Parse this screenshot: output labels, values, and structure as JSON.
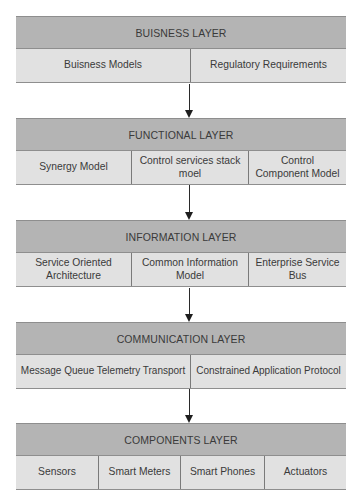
{
  "diagram": {
    "layers": [
      {
        "title": "BUISNESS LAYER",
        "items": [
          "Buisness Models",
          "Regulatory Requirements"
        ]
      },
      {
        "title": "FUNCTIONAL LAYER",
        "items": [
          "Synergy Model",
          "Control services stack moel",
          "Control Component Model"
        ]
      },
      {
        "title": "INFORMATION LAYER",
        "items": [
          "Service Oriented Architecture",
          "Common Information Model",
          "Enterprise Service Bus"
        ]
      },
      {
        "title": "COMMUNICATION LAYER",
        "items": [
          "Message Queue Telemetry Transport",
          "Constrained Application Protocol"
        ]
      },
      {
        "title": "COMPONENTS LAYER",
        "items": [
          "Sensors",
          "Smart Meters",
          "Smart Phones",
          "Actuators"
        ]
      }
    ],
    "colors": {
      "header": "#b4b4b4",
      "row": "#e1e1e1",
      "border": "#8e8e8e",
      "arrow": "#1e1e1e"
    }
  }
}
